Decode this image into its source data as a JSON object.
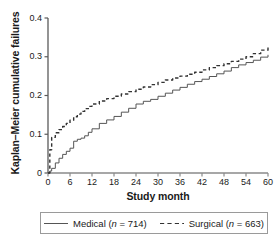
{
  "chart_data": {
    "type": "line",
    "title": "",
    "xlabel": "Study month",
    "ylabel": "Kaplan–Meier cumulative failures",
    "xlim": [
      0,
      60
    ],
    "ylim": [
      0,
      0.4
    ],
    "xticks": [
      "0",
      "6",
      "12",
      "18",
      "24",
      "30",
      "36",
      "42",
      "48",
      "54",
      "60"
    ],
    "xtick_values": [
      0,
      6,
      12,
      18,
      24,
      30,
      36,
      42,
      48,
      54,
      60
    ],
    "yticks": [
      "0",
      "0.1",
      "0.2",
      "0.3",
      "0.4"
    ],
    "ytick_values": [
      0,
      0.1,
      0.2,
      0.3,
      0.4
    ],
    "grid": false,
    "legend_position": "bottom",
    "x": [
      0,
      0.5,
      1,
      2,
      3,
      4,
      5,
      6,
      7,
      8,
      9,
      10,
      11,
      12,
      14,
      16,
      18,
      20,
      22,
      24,
      26,
      28,
      30,
      32,
      34,
      36,
      38,
      40,
      42,
      44,
      46,
      48,
      50,
      52,
      54,
      56,
      58,
      60
    ],
    "series": [
      {
        "name": "Medical",
        "n": 714,
        "label": "Medical (n = 714)",
        "style": "solid",
        "color": "#555555",
        "values": [
          0,
          0.005,
          0.012,
          0.026,
          0.038,
          0.048,
          0.056,
          0.064,
          0.082,
          0.087,
          0.09,
          0.096,
          0.105,
          0.114,
          0.128,
          0.137,
          0.146,
          0.157,
          0.167,
          0.178,
          0.185,
          0.19,
          0.198,
          0.206,
          0.214,
          0.221,
          0.229,
          0.236,
          0.242,
          0.249,
          0.256,
          0.263,
          0.272,
          0.279,
          0.285,
          0.291,
          0.299,
          0.305
        ]
      },
      {
        "name": "Surgical",
        "n": 663,
        "label": "Surgical (n = 663)",
        "style": "dashed",
        "color": "#333333",
        "values": [
          0,
          0.06,
          0.092,
          0.104,
          0.112,
          0.12,
          0.128,
          0.136,
          0.145,
          0.152,
          0.159,
          0.166,
          0.172,
          0.178,
          0.186,
          0.192,
          0.198,
          0.204,
          0.21,
          0.216,
          0.222,
          0.228,
          0.234,
          0.24,
          0.245,
          0.25,
          0.255,
          0.26,
          0.266,
          0.272,
          0.277,
          0.282,
          0.288,
          0.294,
          0.3,
          0.308,
          0.317,
          0.325
        ]
      }
    ]
  },
  "legend": {
    "medical": "Medical (",
    "medical_n": "n",
    "medical_rest": " = 714)",
    "surgical": "Surgical (",
    "surgical_n": "n",
    "surgical_rest": " = 663)"
  }
}
